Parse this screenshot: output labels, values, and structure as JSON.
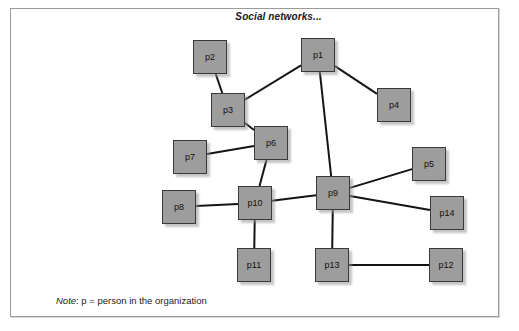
{
  "figure": {
    "title": "Social networks...",
    "note_label": "Note",
    "note_text": ": p = person in the organization",
    "border_color": "#9b9b9b",
    "node_fill": "#9d9d9d",
    "node_stroke": "#3a3a3a",
    "edge_color": "#141414",
    "background": "#ffffff"
  },
  "graph": {
    "type": "node-link-diagram",
    "node_size": 34,
    "nodes": [
      {
        "id": "p1",
        "label": "p1",
        "x": 301,
        "y": 38
      },
      {
        "id": "p2",
        "label": "p2",
        "x": 193,
        "y": 40
      },
      {
        "id": "p3",
        "label": "p3",
        "x": 211,
        "y": 93
      },
      {
        "id": "p4",
        "label": "p4",
        "x": 377,
        "y": 88
      },
      {
        "id": "p5",
        "label": "p5",
        "x": 412,
        "y": 147
      },
      {
        "id": "p6",
        "label": "p6",
        "x": 254,
        "y": 126
      },
      {
        "id": "p7",
        "label": "p7",
        "x": 173,
        "y": 140
      },
      {
        "id": "p8",
        "label": "p8",
        "x": 162,
        "y": 190
      },
      {
        "id": "p9",
        "label": "p9",
        "x": 316,
        "y": 176
      },
      {
        "id": "p10",
        "label": "p10",
        "x": 238,
        "y": 186
      },
      {
        "id": "p11",
        "label": "p11",
        "x": 237,
        "y": 248
      },
      {
        "id": "p12",
        "label": "p12",
        "x": 429,
        "y": 248
      },
      {
        "id": "p13",
        "label": "p13",
        "x": 315,
        "y": 248
      },
      {
        "id": "p14",
        "label": "p14",
        "x": 430,
        "y": 196
      }
    ],
    "edges": [
      {
        "source": "p2",
        "target": "p3"
      },
      {
        "source": "p3",
        "target": "p1"
      },
      {
        "source": "p3",
        "target": "p6"
      },
      {
        "source": "p7",
        "target": "p6"
      },
      {
        "source": "p6",
        "target": "p10"
      },
      {
        "source": "p1",
        "target": "p4"
      },
      {
        "source": "p1",
        "target": "p9"
      },
      {
        "source": "p8",
        "target": "p10"
      },
      {
        "source": "p10",
        "target": "p9"
      },
      {
        "source": "p10",
        "target": "p11"
      },
      {
        "source": "p9",
        "target": "p5"
      },
      {
        "source": "p9",
        "target": "p14"
      },
      {
        "source": "p9",
        "target": "p13"
      },
      {
        "source": "p13",
        "target": "p12"
      }
    ]
  }
}
